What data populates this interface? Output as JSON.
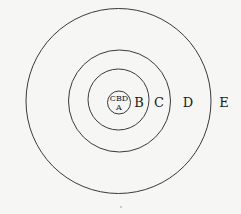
{
  "diagram": {
    "center": {
      "x": 119,
      "y": 101
    },
    "rings": [
      {
        "name": "zone-a",
        "r": 11.5
      },
      {
        "name": "zone-b",
        "r": 30.5
      },
      {
        "name": "zone-c",
        "r": 51.5
      },
      {
        "name": "zone-d",
        "r": 92.5
      }
    ],
    "labels": {
      "cbd": "CBD",
      "a": "A",
      "b": "B",
      "c": "C",
      "d": "D",
      "e": "E"
    },
    "stroke_color": "#3a3a3a",
    "background_color": "#f6f6f4"
  }
}
